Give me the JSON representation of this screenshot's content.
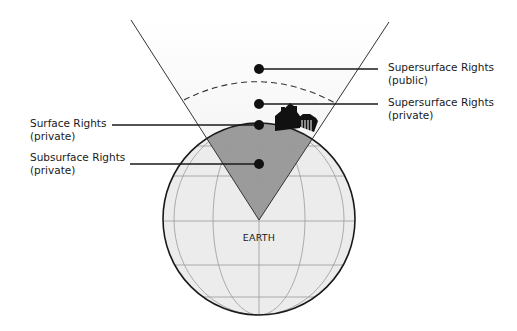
{
  "diagram": {
    "title": "",
    "colors": {
      "globe_fill": "#ececec",
      "globe_outline": "#1a1a1a",
      "grid_lines": "#9a9a9a",
      "wedge_fill": "#9b9b9b",
      "cone_fill": "#f1f1f1",
      "lines": "#1a1a1a",
      "dots": "#111111"
    },
    "labels": {
      "supersurface_public": {
        "line1": "Supersurface Rights",
        "line2": "(public)"
      },
      "supersurface_private": {
        "line1": "Supersurface Rights",
        "line2": "(private)"
      },
      "surface": {
        "line1": "Surface Rights",
        "line2": "(private)"
      },
      "subsurface": {
        "line1": "Subsurface Rights",
        "line2": "(private)"
      },
      "earth": "EARTH"
    },
    "nodes": [
      {
        "id": "supersurface-public",
        "side": "right"
      },
      {
        "id": "supersurface-private",
        "side": "right"
      },
      {
        "id": "surface",
        "side": "left"
      },
      {
        "id": "subsurface",
        "side": "left"
      }
    ],
    "icons": [
      "house-icon",
      "building-icon",
      "globe-icon"
    ]
  }
}
